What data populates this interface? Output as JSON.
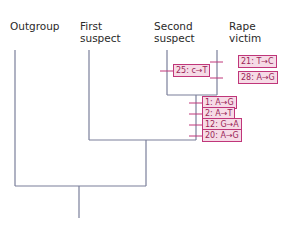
{
  "taxa": [
    {
      "id": "outgroup",
      "label": "Outgroup"
    },
    {
      "id": "first_suspect",
      "label": "First\nsuspect"
    },
    {
      "id": "second_suspect",
      "label": "Second\nsuspect"
    },
    {
      "id": "rape_victim",
      "label": "Rape\nvictim"
    }
  ],
  "mutations": {
    "second_suspect": [
      "25: c→T"
    ],
    "rape_victim": [
      "21: T→C",
      "28: A→G"
    ],
    "victim_suspect_clade": [
      "1: A→G",
      "2: A→T",
      "12: G→A",
      "20: A→G"
    ]
  },
  "colors": {
    "branch": "#7a7f9a",
    "mutation_border": "#c0367a",
    "mutation_fill": "#f6dbe6",
    "mutation_text": "#9a1f58"
  }
}
